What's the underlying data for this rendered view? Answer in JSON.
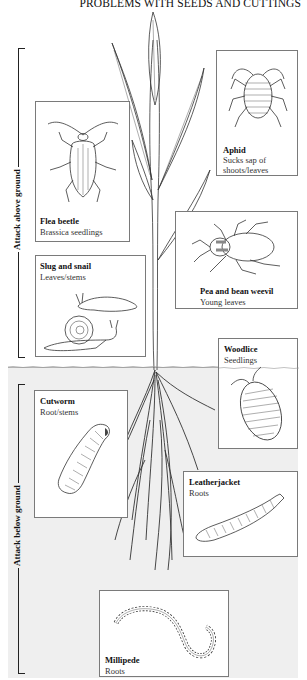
{
  "title": "PROBLEMS WITH SEEDS AND CUTTINGS",
  "sections": {
    "above": {
      "label": "Attack above ground"
    },
    "below": {
      "label": "Attack below ground"
    }
  },
  "pests": [
    {
      "id": "aphid",
      "name": "Aphid",
      "damage": "Sucks sap of shoots/leaves",
      "damage_line1": "Sucks sap of",
      "damage_line2": "shoots/leaves",
      "zone": "above"
    },
    {
      "id": "flea-beetle",
      "name": "Flea beetle",
      "damage": "Brassica seedlings",
      "zone": "above"
    },
    {
      "id": "slug-and-snail",
      "name": "Slug and snail",
      "damage": "Leaves/stems",
      "zone": "above"
    },
    {
      "id": "pea-and-bean-weevil",
      "name": "Pea and bean weevil",
      "damage": "Young leaves",
      "zone": "above"
    },
    {
      "id": "woodlice",
      "name": "Woodlice",
      "damage": "Seedlings",
      "zone": "above"
    },
    {
      "id": "cutworm",
      "name": "Cutworm",
      "damage": "Root/stems",
      "zone": "below"
    },
    {
      "id": "leatherjacket",
      "name": "Leatherjacket",
      "damage": "Roots",
      "zone": "below"
    },
    {
      "id": "millipede",
      "name": "Millipede",
      "damage": "Roots",
      "zone": "below"
    }
  ],
  "colors": {
    "background": "#ffffff",
    "below_ground_bg": "#efefef",
    "line": "#222222",
    "box_border": "#7a7a7a"
  }
}
